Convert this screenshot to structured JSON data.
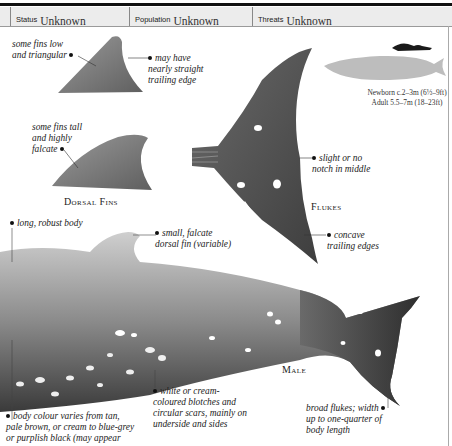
{
  "header": {
    "cells": [
      {
        "label": "Status",
        "value": "Unknown"
      },
      {
        "label": "Population",
        "value": "Unknown"
      },
      {
        "label": "Threats",
        "value": "Unknown"
      }
    ]
  },
  "size_comparison": {
    "newborn": "Newborn c.2–3m (6½–9ft)",
    "adult": "Adult 5.5–7m (18–23ft)",
    "icons": [
      "diver-silhouette-icon",
      "whale-silhouette-icon"
    ]
  },
  "dorsal_fins": {
    "caption": "Dorsal Fins",
    "notes": {
      "low_triangular": [
        "some fins low",
        "and triangular"
      ],
      "straight_edge": [
        "may have",
        "nearly straight",
        "trailing edge"
      ],
      "tall_falcate": [
        "some fins tall",
        "and highly",
        "falcate"
      ]
    }
  },
  "flukes": {
    "caption": "Flukes",
    "notes": {
      "notch": [
        "slight or no",
        "notch in middle"
      ],
      "concave": [
        "concave",
        "trailing edges"
      ]
    }
  },
  "male": {
    "caption": "Male",
    "notes": {
      "body": [
        "long, robust body"
      ],
      "dorsal": [
        "small, falcate",
        "dorsal fin (variable)"
      ],
      "blotches": [
        "white or cream-",
        "coloured blotches and",
        "circular scars, mainly on",
        "underside and sides"
      ],
      "colour": [
        "body colour varies from tan,",
        "pale brown, or cream to blue-grey",
        "or purplish black (may appear"
      ],
      "broad_flukes": [
        "broad flukes; width",
        "up to one-quarter of",
        "body length"
      ]
    }
  },
  "colors": {
    "header_bg": "#ececec",
    "illustration_grey": "#7a7a7a",
    "silhouette_grey": "#bdbdbd",
    "text": "#1a1a1a"
  }
}
